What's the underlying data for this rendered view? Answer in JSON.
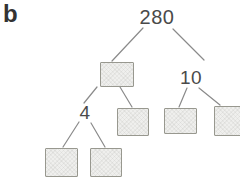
{
  "figure": {
    "part_label": "b",
    "kind": "factor-tree"
  },
  "tree": {
    "root": "280",
    "right_child_label": "10",
    "left_grandchild_label": "4",
    "empty_box_count": 6
  },
  "colors": {
    "background": "#ffffff",
    "text": "#4a4a4a",
    "part_label_text": "#333333",
    "branch_line": "#8a8a8a",
    "box_fill": "#efefed",
    "box_border": "#98988f"
  }
}
